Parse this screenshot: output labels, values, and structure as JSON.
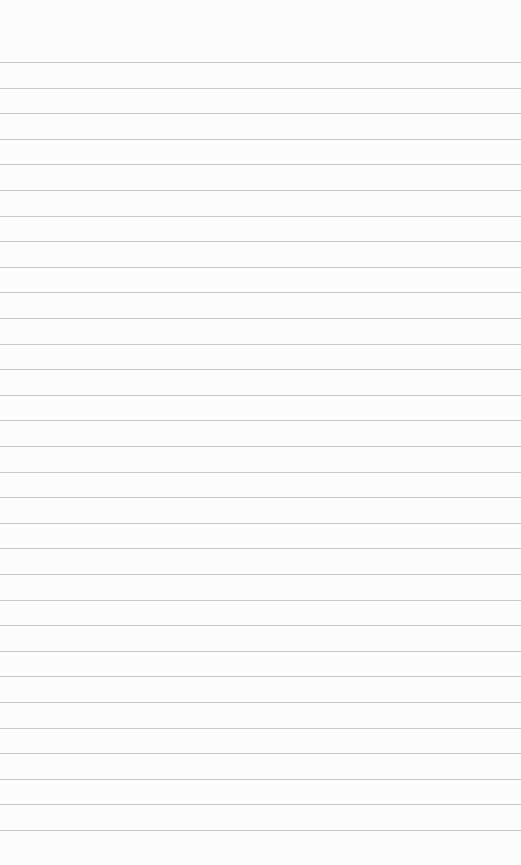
{
  "paper": {
    "type": "lined-notebook-paper",
    "background_color": "#fcfcfc",
    "line_color": "#c9c9c9",
    "first_line_y": 62,
    "line_spacing": 25.6,
    "line_count": 31,
    "text": ""
  }
}
